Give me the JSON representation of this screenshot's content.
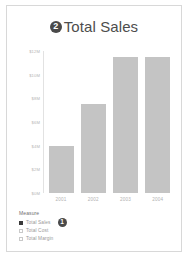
{
  "card": {
    "title": "Total Sales",
    "title_badge": "2"
  },
  "chart_data": {
    "type": "bar",
    "title": "Total Sales",
    "xlabel": "",
    "ylabel": "",
    "categories": [
      "2001",
      "2002",
      "2003",
      "2004"
    ],
    "values": [
      4000000,
      7600000,
      11600000,
      11600000
    ],
    "series": [
      {
        "name": "Total Sales",
        "values": [
          4000000,
          7600000,
          11600000,
          11600000
        ]
      }
    ],
    "ylim": [
      0,
      12000000
    ],
    "yticks": [
      0,
      2000000,
      4000000,
      6000000,
      8000000,
      10000000,
      12000000
    ],
    "ytick_labels": [
      "$0M",
      "$2M",
      "$4M",
      "$6M",
      "$8M",
      "$10M",
      "$12M"
    ],
    "bar_percents": [
      33,
      63,
      96,
      96
    ],
    "grid": false,
    "legend_position": "bottom-left",
    "bar_color": "#c4c4c4"
  },
  "legend": {
    "title": "Measure",
    "items": [
      {
        "label": "Total Sales",
        "checked": true,
        "badge": "1"
      },
      {
        "label": "Total Cost",
        "checked": false,
        "badge": ""
      },
      {
        "label": "Total Margin",
        "checked": false,
        "badge": ""
      }
    ]
  },
  "colors": {
    "bar": "#c4c4c4",
    "badge": "#4a4a4a",
    "border": "#d8d8d8",
    "title_text": "#4d4d4d"
  }
}
